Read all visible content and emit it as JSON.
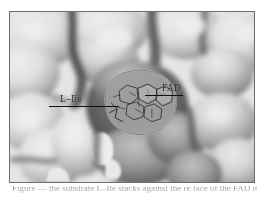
{
  "figure": {
    "kind": "molecular-surface-rendering",
    "colormode": "grayscale",
    "alt": "Grayscale molecular surface of an enzyme active-site pocket with a bound ligand at the centre",
    "panel": {
      "border_color": "#6d6d6d",
      "background_color": "#fbfbfb"
    },
    "annotations": [
      {
        "id": "ligand-l-ile",
        "label": "L–Ile",
        "leader": "horizontal-line-left"
      },
      {
        "id": "cofactor-fad",
        "label": "FAD",
        "leader": "horizontal-line-left"
      }
    ],
    "caption": {
      "text": "Figure — the substrate L–Ile stacks against the re face of the FAD isoalloxazine ring.",
      "visible": "partially-cropped"
    },
    "colors": {
      "annotation_text": "#0b0b0b",
      "leader_line": "#111111",
      "surface_light": "#ffffff",
      "surface_mid": "#9a9a9a",
      "surface_dark": "#3a3a3a",
      "ligand_outline": "#2b2b2b"
    }
  }
}
